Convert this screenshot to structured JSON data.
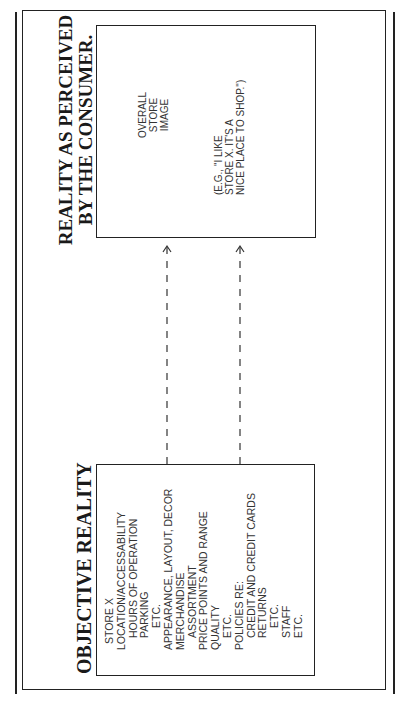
{
  "diagram": {
    "perceived": {
      "title_lines": [
        "REALITY AS PERCEIVED",
        "BY THE CONSUMER."
      ],
      "overall_lines": [
        "OVERALL",
        "STORE",
        "IMAGE"
      ],
      "example_lines": [
        "(E.G., \"I LIKE",
        "STORE X. IT'S A",
        "NICE PLACE TO SHOP.\")"
      ]
    },
    "objective": {
      "title": "OBJECTIVE REALITY",
      "items": [
        {
          "text": "STORE X",
          "level": 3
        },
        {
          "text": "LOCATION/ACCESSABILITY",
          "level": 0
        },
        {
          "text": "HOURS OF OPERATION",
          "level": 1
        },
        {
          "text": "PARKING",
          "level": 1
        },
        {
          "text": "ETC.",
          "level": 2
        },
        {
          "text": "APPEARANCE, LAYOUT, DECOR",
          "level": 0
        },
        {
          "text": "MERCHANDISE",
          "level": 0
        },
        {
          "text": "ASSORTMENT",
          "level": 1
        },
        {
          "text": "PRICE POINTS AND RANGE",
          "level": 0
        },
        {
          "text": "QUALITY",
          "level": 0
        },
        {
          "text": "ETC.",
          "level": 1
        },
        {
          "text": "POLICIES RE:",
          "level": 0
        },
        {
          "text": "CREDIT AND CREDIT CARDS",
          "level": 1
        },
        {
          "text": "RETURNS",
          "level": 1
        },
        {
          "text": "ETC.",
          "level": 2
        },
        {
          "text": "STAFF",
          "level": 1
        },
        {
          "text": "ETC.",
          "level": 1
        }
      ]
    },
    "arrows": [
      {
        "from": "objective",
        "to": "perceived",
        "style": "dashed"
      },
      {
        "from": "objective",
        "to": "perceived",
        "style": "dashed"
      }
    ]
  }
}
